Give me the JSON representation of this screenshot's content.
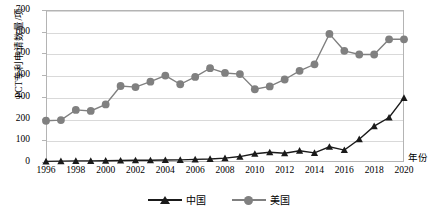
{
  "chart_data": {
    "type": "line",
    "title": "",
    "xlabel": "年份",
    "ylabel": "PCT专利申请数量/项",
    "ylim": [
      0,
      700
    ],
    "ytick_labels": [
      "0",
      "100",
      "200",
      "300",
      "400",
      "500",
      "600",
      "700"
    ],
    "yticks": [
      0,
      100,
      200,
      300,
      400,
      500,
      600,
      700
    ],
    "grid": true,
    "legend_position": "bottom-center",
    "x": [
      1996,
      1997,
      1998,
      1999,
      2000,
      2001,
      2002,
      2003,
      2004,
      2005,
      2006,
      2007,
      2008,
      2009,
      2010,
      2011,
      2012,
      2013,
      2014,
      2015,
      2016,
      2017,
      2018,
      2019,
      2020
    ],
    "xtick_labels": [
      "1996",
      "1998",
      "2000",
      "2002",
      "2004",
      "2006",
      "2008",
      "2010",
      "2012",
      "2014",
      "2016",
      "2018",
      "2020"
    ],
    "xticks": [
      1996,
      1998,
      2000,
      2002,
      2004,
      2006,
      2008,
      2010,
      2012,
      2014,
      2016,
      2018,
      2020
    ],
    "series": [
      {
        "name": "中国",
        "marker": "triangle",
        "color": "#1a1a1a",
        "values": [
          3,
          4,
          5,
          5,
          6,
          7,
          8,
          8,
          9,
          10,
          12,
          14,
          18,
          25,
          38,
          45,
          40,
          52,
          42,
          70,
          55,
          105,
          165,
          205,
          295
        ]
      },
      {
        "name": "美国",
        "marker": "circle",
        "color": "#808080",
        "values": [
          190,
          193,
          240,
          235,
          265,
          350,
          345,
          370,
          398,
          358,
          392,
          432,
          410,
          405,
          335,
          348,
          380,
          420,
          450,
          590,
          512,
          495,
          495,
          565,
          565
        ]
      }
    ]
  },
  "legend": {
    "items": [
      {
        "label": "中国"
      },
      {
        "label": "美国"
      }
    ]
  }
}
